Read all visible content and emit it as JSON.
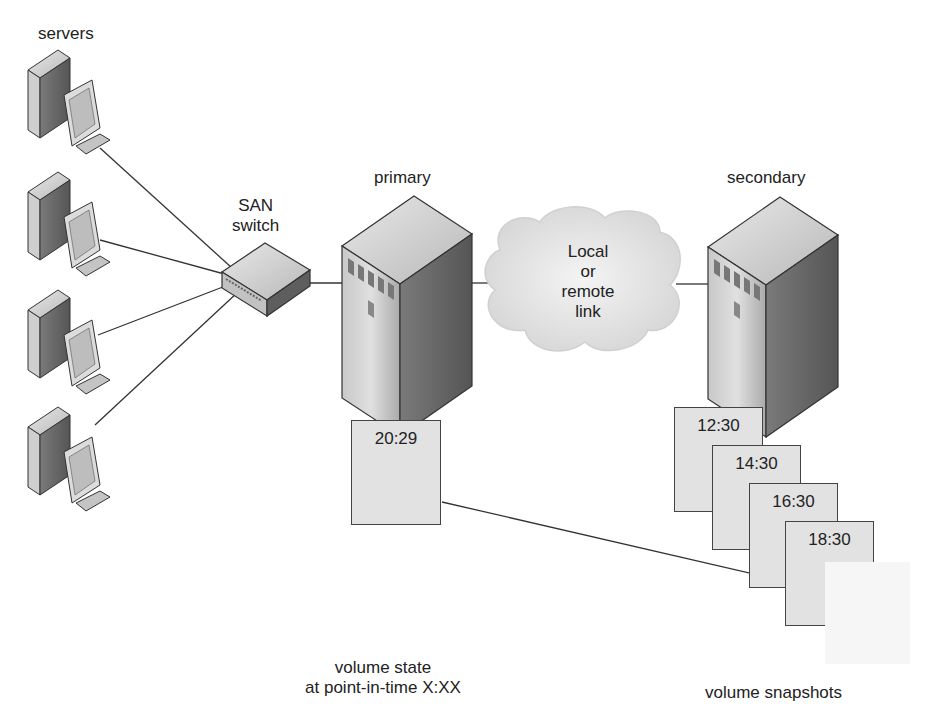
{
  "labels": {
    "servers": "servers",
    "san_switch": "SAN\nswitch",
    "san_switch_line1": "SAN",
    "san_switch_line2": "switch",
    "primary": "primary",
    "secondary": "secondary",
    "link_line1": "Local",
    "link_line2": "or",
    "link_line3": "remote",
    "link_line4": "link",
    "volume_state_line1": "volume state",
    "volume_state_line2": "at point-in-time X:XX",
    "volume_snapshots": "volume snapshots"
  },
  "primary_volume": {
    "time": "20:29"
  },
  "snapshots": [
    {
      "time": "12:30"
    },
    {
      "time": "14:30"
    },
    {
      "time": "16:30"
    },
    {
      "time": "18:30"
    }
  ],
  "colors": {
    "line": "#333333",
    "volume_fill": "#e2e2e2",
    "cloud_fill": "#e6e6e6",
    "server_light": "#d0d0d0",
    "server_dark": "#6e6e6e"
  }
}
